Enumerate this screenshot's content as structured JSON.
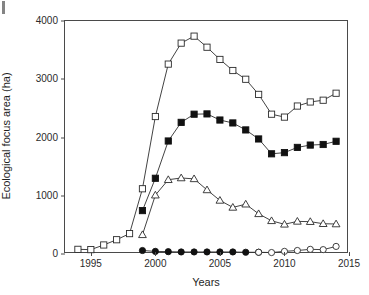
{
  "chart_data": {
    "type": "line",
    "title": "",
    "xlabel": "Years",
    "ylabel": "Ecological focus area (ha)",
    "xlim": [
      1993,
      2015
    ],
    "ylim": [
      0,
      4000
    ],
    "xticks": [
      1995,
      2000,
      2005,
      2010,
      2015
    ],
    "yticks": [
      0,
      1000,
      2000,
      3000,
      4000
    ],
    "grid": false,
    "legend": "none",
    "series": [
      {
        "name": "open-square-series",
        "marker": "open-square",
        "x": [
          1994,
          1995,
          1996,
          1997,
          1998,
          1999,
          2000,
          2001,
          2002,
          2003,
          2004,
          2005,
          2006,
          2007,
          2008,
          2009,
          2010,
          2011,
          2012,
          2013,
          2014
        ],
        "values": [
          80,
          75,
          155,
          245,
          350,
          1120,
          2360,
          3260,
          3620,
          3740,
          3550,
          3340,
          3150,
          3000,
          2740,
          2400,
          2350,
          2540,
          2610,
          2640,
          2760
        ]
      },
      {
        "name": "filled-square-series",
        "marker": "filled-square",
        "x": [
          1999,
          2000,
          2001,
          2002,
          2003,
          2004,
          2005,
          2006,
          2007,
          2008,
          2009,
          2010,
          2011,
          2012,
          2013,
          2014
        ],
        "values": [
          745,
          1300,
          1940,
          2260,
          2400,
          2405,
          2300,
          2250,
          2130,
          1975,
          1720,
          1740,
          1830,
          1870,
          1880,
          1935
        ]
      },
      {
        "name": "open-triangle-series",
        "marker": "open-triangle",
        "x": [
          1999,
          2000,
          2001,
          2002,
          2003,
          2004,
          2005,
          2006,
          2007,
          2008,
          2009,
          2010,
          2011,
          2012,
          2013,
          2014
        ],
        "values": [
          330,
          1010,
          1275,
          1305,
          1290,
          1100,
          920,
          800,
          855,
          690,
          570,
          510,
          560,
          555,
          520,
          515
        ]
      },
      {
        "name": "filled-circle-series",
        "marker": "filled-circle",
        "x": [
          1999,
          2000,
          2001,
          2002,
          2003,
          2004,
          2005,
          2006,
          2007,
          2008
        ],
        "values": [
          60,
          45,
          40,
          35,
          35,
          35,
          35,
          35,
          30,
          30
        ]
      },
      {
        "name": "open-circle-series",
        "marker": "open-circle",
        "x": [
          2008,
          2009,
          2010,
          2011,
          2012,
          2013,
          2014
        ],
        "values": [
          30,
          25,
          45,
          60,
          80,
          75,
          130
        ]
      }
    ]
  },
  "axes": {
    "y_label": "Ecological focus area (ha)",
    "x_label": "Years",
    "y_tick_labels": [
      "0",
      "1000",
      "2000",
      "3000",
      "4000"
    ],
    "x_tick_labels": [
      "1995",
      "2000",
      "2005",
      "2010",
      "2015"
    ]
  }
}
